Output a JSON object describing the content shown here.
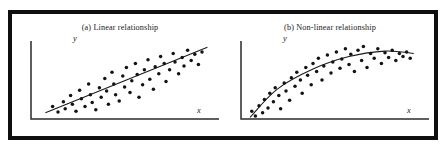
{
  "figure": {
    "frame_color": "#100f0d",
    "background_color": "#ffffff",
    "ink_color": "#131313"
  },
  "panels": [
    {
      "id": "a",
      "caption": "(a)  Linear relationship",
      "x_axis_label": "x",
      "y_axis_label": "y"
    },
    {
      "id": "b",
      "caption": "(b)  Non-linear relationship",
      "x_axis_label": "x",
      "y_axis_label": "y"
    }
  ],
  "chart_data": [
    {
      "type": "scatter",
      "title": "(a)  Linear relationship",
      "xlabel": "x",
      "ylabel": "y",
      "xlim": [
        0,
        100
      ],
      "ylim": [
        0,
        100
      ],
      "grid": false,
      "legend": "none",
      "annotations": [
        "straight fitted trend line rising left to right"
      ],
      "points": [
        [
          12,
          16
        ],
        [
          15,
          9
        ],
        [
          18,
          22
        ],
        [
          19,
          13
        ],
        [
          22,
          30
        ],
        [
          23,
          19
        ],
        [
          25,
          10
        ],
        [
          27,
          37
        ],
        [
          28,
          26
        ],
        [
          30,
          16
        ],
        [
          32,
          45
        ],
        [
          33,
          31
        ],
        [
          34,
          21
        ],
        [
          36,
          12
        ],
        [
          38,
          40
        ],
        [
          39,
          28
        ],
        [
          41,
          52
        ],
        [
          42,
          36
        ],
        [
          43,
          19
        ],
        [
          45,
          60
        ],
        [
          46,
          45
        ],
        [
          47,
          31
        ],
        [
          49,
          23
        ],
        [
          51,
          55
        ],
        [
          52,
          41
        ],
        [
          53,
          66
        ],
        [
          55,
          34
        ],
        [
          56,
          49
        ],
        [
          58,
          71
        ],
        [
          59,
          57
        ],
        [
          60,
          28
        ],
        [
          62,
          44
        ],
        [
          63,
          63
        ],
        [
          65,
          76
        ],
        [
          66,
          51
        ],
        [
          68,
          38
        ],
        [
          69,
          67
        ],
        [
          71,
          58
        ],
        [
          72,
          80
        ],
        [
          74,
          71
        ],
        [
          75,
          48
        ],
        [
          77,
          63
        ],
        [
          79,
          84
        ],
        [
          80,
          73
        ],
        [
          82,
          58
        ],
        [
          84,
          79
        ],
        [
          85,
          68
        ],
        [
          87,
          88
        ],
        [
          89,
          75
        ],
        [
          91,
          83
        ],
        [
          93,
          70
        ],
        [
          95,
          86
        ]
      ],
      "trend": {
        "kind": "line",
        "x": [
          8,
          98
        ],
        "y": [
          8,
          92
        ]
      }
    },
    {
      "type": "scatter",
      "title": "(b)  Non-linear relationship",
      "xlabel": "x",
      "ylabel": "y",
      "xlim": [
        0,
        100
      ],
      "ylim": [
        0,
        100
      ],
      "grid": false,
      "legend": "none",
      "annotations": [
        "curved (concave-down) fitted trend line that rises steeply then flattens"
      ],
      "points": [
        [
          6,
          10
        ],
        [
          8,
          4
        ],
        [
          10,
          17
        ],
        [
          12,
          8
        ],
        [
          13,
          25
        ],
        [
          15,
          14
        ],
        [
          16,
          33
        ],
        [
          18,
          22
        ],
        [
          19,
          40
        ],
        [
          21,
          30
        ],
        [
          22,
          13
        ],
        [
          24,
          46
        ],
        [
          25,
          36
        ],
        [
          27,
          24
        ],
        [
          28,
          53
        ],
        [
          30,
          42
        ],
        [
          31,
          60
        ],
        [
          33,
          50
        ],
        [
          34,
          33
        ],
        [
          36,
          66
        ],
        [
          37,
          56
        ],
        [
          39,
          44
        ],
        [
          40,
          71
        ],
        [
          42,
          61
        ],
        [
          43,
          78
        ],
        [
          45,
          50
        ],
        [
          46,
          68
        ],
        [
          48,
          82
        ],
        [
          50,
          59
        ],
        [
          51,
          73
        ],
        [
          53,
          86
        ],
        [
          55,
          65
        ],
        [
          56,
          77
        ],
        [
          58,
          90
        ],
        [
          60,
          70
        ],
        [
          61,
          83
        ],
        [
          63,
          61
        ],
        [
          65,
          88
        ],
        [
          67,
          75
        ],
        [
          68,
          93
        ],
        [
          70,
          66
        ],
        [
          72,
          84
        ],
        [
          74,
          78
        ],
        [
          76,
          90
        ],
        [
          78,
          71
        ],
        [
          80,
          85
        ],
        [
          82,
          79
        ],
        [
          84,
          88
        ],
        [
          86,
          75
        ],
        [
          88,
          84
        ],
        [
          90,
          80
        ],
        [
          92,
          86
        ],
        [
          94,
          78
        ]
      ],
      "trend": {
        "kind": "curve",
        "x": [
          5,
          20,
          40,
          60,
          80,
          96
        ],
        "y": [
          2,
          38,
          64,
          80,
          87,
          84
        ]
      }
    }
  ]
}
